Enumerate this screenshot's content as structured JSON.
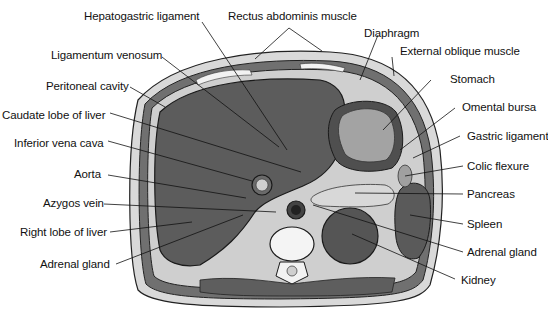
{
  "diagram": {
    "type": "anatomical cross-section",
    "colors": {
      "skin": "#d6d6d6",
      "muscle": "#6e6e6e",
      "liver": "#5c5c5c",
      "fat": "#cfcfcf",
      "stomach": "#9a9a9a",
      "kidney": "#555555",
      "bone": "#f2f2f2",
      "outline": "#1a1a1a"
    },
    "labels_left": [
      {
        "text": "Hepatogastric ligament"
      },
      {
        "text": "Ligamentum venosum"
      },
      {
        "text": "Peritoneal cavity"
      },
      {
        "text": "Caudate lobe of liver"
      },
      {
        "text": "Inferior vena cava"
      },
      {
        "text": "Aorta"
      },
      {
        "text": "Azygos vein"
      },
      {
        "text": "Right lobe of liver"
      },
      {
        "text": "Adrenal gland"
      }
    ],
    "labels_top": [
      {
        "text": "Rectus abdominis muscle"
      },
      {
        "text": "Diaphragm"
      }
    ],
    "labels_right": [
      {
        "text": "External oblique muscle"
      },
      {
        "text": "Stomach"
      },
      {
        "text": "Omental bursa"
      },
      {
        "text": "Gastric ligament"
      },
      {
        "text": "Colic flexure"
      },
      {
        "text": "Pancreas"
      },
      {
        "text": "Spleen"
      },
      {
        "text": "Adrenal gland"
      },
      {
        "text": "Kidney"
      }
    ]
  }
}
